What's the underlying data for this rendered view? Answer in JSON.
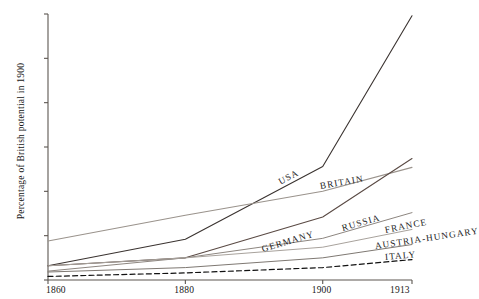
{
  "chart_data": {
    "type": "line",
    "title": "",
    "xlabel": "",
    "ylabel": "Percentage of British potential in 1900",
    "x": [
      1860,
      1880,
      1900,
      1913
    ],
    "xtick_labels": [
      "1860",
      "1880",
      "1900",
      "1913"
    ],
    "ytick_labels": [
      "0",
      "50",
      "100",
      "150",
      "200",
      "250",
      "300"
    ],
    "yticks": [
      0,
      50,
      100,
      150,
      200,
      250,
      300
    ],
    "ylim": [
      0,
      300
    ],
    "xlim": [
      1860,
      1913
    ],
    "grid": false,
    "legend": "inline-labels",
    "series": [
      {
        "name": "USA",
        "label": "USA",
        "values": [
          16,
          46,
          128,
          298
        ],
        "color": "#3a3330",
        "width": 1.1,
        "dash": "none"
      },
      {
        "name": "Britain",
        "label": "BRITAIN",
        "values": [
          44,
          73,
          100,
          127
        ],
        "color": "#9a938c",
        "width": 1.1,
        "dash": "none"
      },
      {
        "name": "Germany",
        "label": "GERMANY",
        "values": [
          16,
          25,
          71,
          137
        ],
        "color": "#5a4a44",
        "width": 1.1,
        "dash": "none"
      },
      {
        "name": "Russia",
        "label": "RUSSIA",
        "values": [
          10,
          25,
          47,
          76
        ],
        "color": "#8d8680",
        "width": 1.0,
        "dash": "none"
      },
      {
        "name": "France",
        "label": "FRANCE",
        "values": [
          16,
          25,
          37,
          57
        ],
        "color": "#a8a29c",
        "width": 1.0,
        "dash": "none"
      },
      {
        "name": "Austria-Hungary",
        "label": "AUSTRIA-HUNGARY",
        "values": [
          9,
          14,
          25,
          40
        ],
        "color": "#7e7872",
        "width": 1.0,
        "dash": "none"
      },
      {
        "name": "Italy",
        "label": "ITALY",
        "values": [
          4,
          8,
          14,
          23
        ],
        "color": "#111111",
        "width": 1.2,
        "dash": "dashed"
      }
    ]
  },
  "axis": {
    "y_label": "Percentage of British potential in 1900",
    "y_ticks": [
      "300",
      "250",
      "200",
      "150",
      "100",
      "50",
      "0"
    ],
    "x_ticks": [
      "1860",
      "1880",
      "1900",
      "1913"
    ]
  },
  "series_labels": {
    "usa": "USA",
    "britain": "BRITAIN",
    "germany": "GERMANY",
    "russia": "RUSSIA",
    "france": "FRANCE",
    "austria_hungary": "AUSTRIA-HUNGARY",
    "italy": "ITALY"
  },
  "colors": {
    "axis": "#5c5651",
    "usa": "#3a3330",
    "britain": "#9a938c",
    "germany": "#5a4a44",
    "russia": "#8d8680",
    "france": "#a8a29c",
    "austria_hungary": "#7e7872",
    "italy": "#111111",
    "background": "#ffffff",
    "text": "#161616"
  }
}
